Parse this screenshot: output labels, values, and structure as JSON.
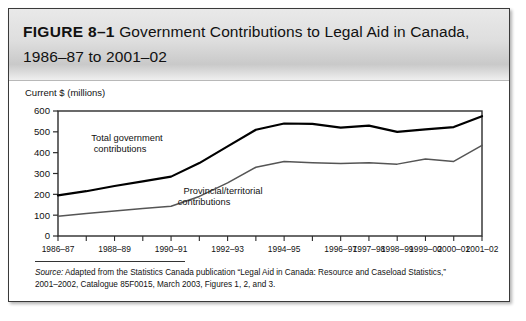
{
  "figure": {
    "number_label": "FIGURE 8–1",
    "title": "Government Contributions to Legal Aid in Canada, 1986–87 to 2001–02"
  },
  "source": {
    "label": "Source:",
    "line1": " Adapted from the Statistics Canada publication “Legal Aid in Canada: Resource and Caseload Statistics,”",
    "line2": "2001–2002, Catalogue 85F0015, March 2003, Figures 1, 2, and 3."
  },
  "chart_data": {
    "type": "line",
    "title": "Government Contributions to Legal Aid in Canada, 1986–87 to 2001–02",
    "xlabel": "",
    "ylabel": "Current $ (millions)",
    "ylim": [
      0,
      600
    ],
    "ytick_labels": [
      "0",
      "100",
      "200",
      "300",
      "400",
      "500",
      "600"
    ],
    "ytick_values": [
      0,
      100,
      200,
      300,
      400,
      500,
      600
    ],
    "grid": false,
    "legend_position": "inline-annotations",
    "x": [
      "1986–87",
      "1987–88",
      "1988–89",
      "1989–90",
      "1990–91",
      "1991–92",
      "1992–93",
      "1993–94",
      "1994–95",
      "1995–96",
      "1996–97",
      "1997–98",
      "1998–99",
      "1999–00",
      "2000–01",
      "2001–02"
    ],
    "xtick_labels_visible": [
      "1986–87",
      "1988–89",
      "1990–91",
      "1992–93",
      "1994–95",
      "1996–97",
      "1997–98",
      "1998–99",
      "1999–00",
      "2000–01",
      "2001–02"
    ],
    "series": [
      {
        "name": "Total government contributions",
        "color": "#000000",
        "values": [
          195,
          215,
          240,
          262,
          285,
          350,
          430,
          510,
          540,
          538,
          520,
          530,
          500,
          512,
          523,
          575
        ]
      },
      {
        "name": "Provincial/territorial contributions",
        "color": "#555555",
        "values": [
          95,
          108,
          120,
          132,
          143,
          190,
          255,
          330,
          358,
          352,
          348,
          352,
          345,
          370,
          358,
          435
        ]
      }
    ],
    "annotations": [
      {
        "text_line1": "Total government",
        "text_line2": "contributions"
      },
      {
        "text_line1": "Provincial/territorial",
        "text_line2": "contributions"
      }
    ]
  }
}
